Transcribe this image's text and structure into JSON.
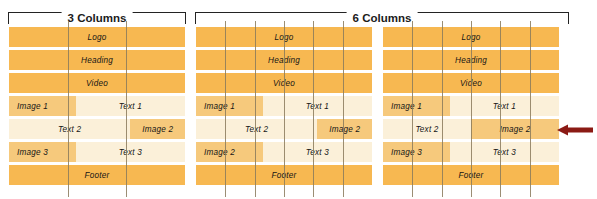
{
  "diagram": {
    "title_sliver": "",
    "colors": {
      "row_dark": "#f7b851",
      "row_light": "#fbf0d9",
      "cell_highlight": "#f6c97c",
      "guide_line": "#8a7a5c",
      "bracket": "#232323",
      "arrow": "#8b1a14",
      "background": "#ffffff"
    },
    "brackets": [
      {
        "label": "3 Columns",
        "spans_panels": 1
      },
      {
        "label": "6 Columns",
        "spans_panels": 2
      }
    ],
    "panels": [
      {
        "name": "three-column-wireframe",
        "columns": 6,
        "guide_count": 2,
        "rows": [
          {
            "type": "full",
            "fill": "dark",
            "label": "Logo"
          },
          {
            "type": "full",
            "fill": "dark",
            "label": "Heading"
          },
          {
            "type": "full",
            "fill": "dark",
            "label": "Video"
          },
          {
            "type": "split",
            "fill": "light",
            "cells": [
              {
                "label": "Image 1",
                "highlight": true,
                "width_pct": 38,
                "align": "left"
              },
              {
                "label": "Text 1",
                "highlight": false,
                "width_pct": 62,
                "align": "center"
              }
            ]
          },
          {
            "type": "split",
            "fill": "light",
            "cells": [
              {
                "label": "Text 2",
                "highlight": false,
                "width_pct": 69,
                "align": "center"
              },
              {
                "label": "Image 2",
                "highlight": true,
                "width_pct": 31,
                "align": "center"
              }
            ]
          },
          {
            "type": "split",
            "fill": "light",
            "cells": [
              {
                "label": "Image 3",
                "highlight": true,
                "width_pct": 38,
                "align": "left"
              },
              {
                "label": "Text 3",
                "highlight": false,
                "width_pct": 62,
                "align": "center"
              }
            ]
          },
          {
            "type": "full",
            "fill": "dark",
            "label": "Footer"
          }
        ]
      },
      {
        "name": "six-column-wireframe-a",
        "columns": 6,
        "guide_count": 5,
        "rows": [
          {
            "type": "full",
            "fill": "dark",
            "label": "Logo"
          },
          {
            "type": "full",
            "fill": "dark",
            "label": "Heading"
          },
          {
            "type": "full",
            "fill": "dark",
            "label": "Video"
          },
          {
            "type": "split",
            "fill": "light",
            "cells": [
              {
                "label": "Image 1",
                "highlight": true,
                "width_pct": 38,
                "align": "left"
              },
              {
                "label": "Text 1",
                "highlight": false,
                "width_pct": 62,
                "align": "center"
              }
            ]
          },
          {
            "type": "split",
            "fill": "light",
            "cells": [
              {
                "label": "Text 2",
                "highlight": false,
                "width_pct": 69,
                "align": "center"
              },
              {
                "label": "Image 2",
                "highlight": true,
                "width_pct": 31,
                "align": "center"
              }
            ]
          },
          {
            "type": "split",
            "fill": "light",
            "cells": [
              {
                "label": "Image 2",
                "highlight": true,
                "width_pct": 38,
                "align": "left"
              },
              {
                "label": "Text 3",
                "highlight": false,
                "width_pct": 62,
                "align": "center"
              }
            ]
          },
          {
            "type": "full",
            "fill": "dark",
            "label": "Footer"
          }
        ]
      },
      {
        "name": "six-column-wireframe-b",
        "columns": 6,
        "guide_count": 5,
        "rows": [
          {
            "type": "full",
            "fill": "dark",
            "label": "Logo"
          },
          {
            "type": "full",
            "fill": "dark",
            "label": "Heading"
          },
          {
            "type": "full",
            "fill": "dark",
            "label": "Video"
          },
          {
            "type": "split",
            "fill": "light",
            "cells": [
              {
                "label": "Image 1",
                "highlight": true,
                "width_pct": 38,
                "align": "left"
              },
              {
                "label": "Text 1",
                "highlight": false,
                "width_pct": 62,
                "align": "center"
              }
            ]
          },
          {
            "type": "split",
            "fill": "light",
            "cells": [
              {
                "label": "Text 2",
                "highlight": false,
                "width_pct": 50,
                "align": "center"
              },
              {
                "label": "Image 2",
                "highlight": true,
                "width_pct": 50,
                "align": "center"
              }
            ]
          },
          {
            "type": "split",
            "fill": "light",
            "cells": [
              {
                "label": "Image 3",
                "highlight": true,
                "width_pct": 38,
                "align": "left"
              },
              {
                "label": "Text 3",
                "highlight": false,
                "width_pct": 62,
                "align": "center"
              }
            ]
          },
          {
            "type": "full",
            "fill": "dark",
            "label": "Footer"
          }
        ]
      }
    ],
    "callout": {
      "name": "image-2-callout-arrow",
      "direction": "left",
      "color": "#8b1a14",
      "points_at_row": "Text 2 / Image 2"
    }
  }
}
